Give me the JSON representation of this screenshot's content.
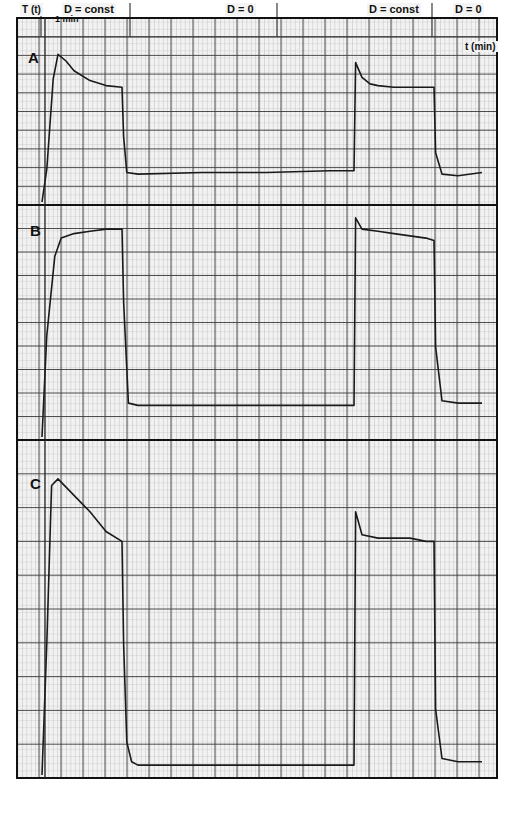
{
  "chart_data": {
    "type": "line",
    "title": "",
    "xlabel": "t (min)",
    "ylabel": "T (t)",
    "grid": true,
    "annotations": {
      "time_scale": "1 min",
      "phase_labels": [
        "D = const",
        "D = 0",
        "D = const",
        "D = 0"
      ]
    },
    "panels": [
      {
        "name": "A",
        "description": "Overshoot then damped oscillation to plateau during D = const; drop to low baseline at D = 0; rise with small overshoot in second D = const; drop at second D = 0",
        "ylim": [
          0,
          100
        ],
        "x": [
          0,
          0.3,
          0.7,
          1.0,
          1.5,
          2,
          3,
          4,
          5,
          5.1,
          5.3,
          6,
          10,
          14,
          18,
          19.5,
          19.6,
          20,
          20.5,
          21,
          22,
          23,
          24,
          24.5,
          24.6,
          25,
          26,
          27.5
        ],
        "values": [
          0,
          20,
          75,
          90,
          86,
          80,
          74,
          71,
          70,
          40,
          18,
          17,
          18,
          18,
          19,
          19,
          85,
          76,
          72,
          71,
          70,
          70,
          70,
          70,
          30,
          17,
          16,
          18
        ]
      },
      {
        "name": "B",
        "description": "Fast rise to plateau during D = const; drop to baseline at D = 0; step rise with slight initial spike and slow decline; drop at second D = 0",
        "ylim": [
          0,
          100
        ],
        "x": [
          0,
          0.3,
          0.8,
          1.2,
          2,
          3,
          4,
          5,
          5.1,
          5.4,
          6,
          10,
          14,
          18,
          19.5,
          19.6,
          20,
          21,
          22,
          23,
          24,
          24.5,
          24.6,
          25,
          26,
          27.5
        ],
        "values": [
          0,
          45,
          80,
          88,
          90,
          91,
          92,
          92,
          60,
          15,
          14,
          14,
          14,
          14,
          14,
          97,
          92,
          91,
          90,
          89,
          88,
          87,
          40,
          16,
          15,
          15
        ]
      },
      {
        "name": "C",
        "description": "Rise with overshoot and slow decay during D = const; drop to baseline at D = 0; step rise with spike then plateau; drop at second D = 0",
        "ylim": [
          0,
          100
        ],
        "x": [
          0,
          0.3,
          0.6,
          1.0,
          2,
          3,
          4,
          5,
          5.1,
          5.3,
          5.6,
          6,
          10,
          14,
          18,
          19.5,
          19.6,
          20,
          21,
          22,
          23,
          24,
          24.5,
          24.6,
          25,
          26,
          27.5
        ],
        "values": [
          0,
          40,
          88,
          90,
          85,
          80,
          74,
          71,
          40,
          10,
          4,
          3,
          3,
          3,
          3,
          3,
          80,
          73,
          72,
          72,
          72,
          71,
          71,
          20,
          5,
          4,
          4
        ]
      }
    ]
  },
  "labels": {
    "y_axis": "T (t)",
    "x_axis": "t (min)",
    "time_scale": "1 min",
    "phase1": "D = const",
    "phase2": "D = 0",
    "phase3": "D = const",
    "phase4": "D = 0",
    "panel_a": "A",
    "panel_b": "B",
    "panel_c": "C"
  },
  "colors": {
    "paper": "#f2f2f2",
    "minor_grid": "#9a9a9a",
    "major_grid": "#3a3a3a",
    "trace": "#1a1a1a"
  }
}
